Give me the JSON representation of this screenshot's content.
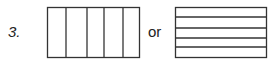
{
  "item_number": "3.",
  "connector": "or",
  "figures": [
    {
      "name": "vertical-strips-rectangle",
      "x": 47,
      "y": 7,
      "w": 93,
      "h": 51,
      "orientation": "vertical",
      "dividers": [
        66,
        87,
        104,
        123
      ]
    },
    {
      "name": "horizontal-strips-rectangle",
      "x": 175,
      "y": 7,
      "w": 92,
      "h": 51,
      "orientation": "horizontal",
      "dividers": [
        17,
        28,
        38,
        47
      ]
    }
  ],
  "colors": {
    "stroke": "#333333",
    "text": "#222222"
  }
}
